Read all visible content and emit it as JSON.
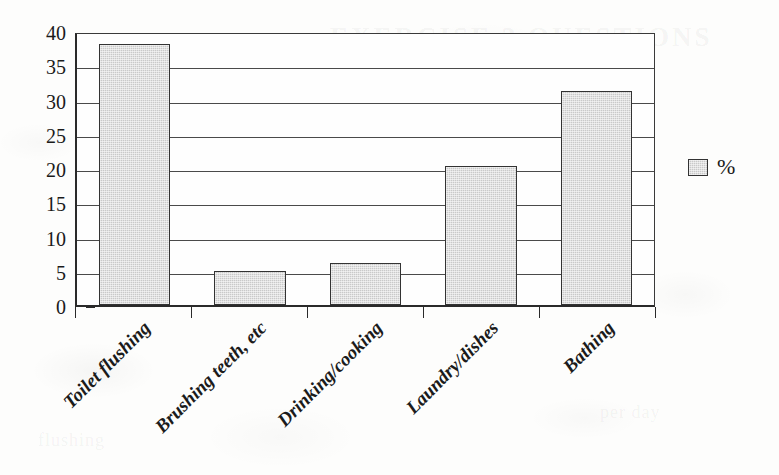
{
  "chart_data": {
    "type": "bar",
    "title": "",
    "subtitle": "",
    "xlabel": "",
    "ylabel": "",
    "categories": [
      "Toilet flushing",
      "Brushing teeth, etc",
      "Drinking/cooking",
      "Laundry/dishes",
      "Bathing"
    ],
    "values": [
      38.1,
      5.0,
      6.1,
      20.3,
      31.2
    ],
    "series": [
      {
        "name": "%",
        "values": [
          38.1,
          5.0,
          6.1,
          20.3,
          31.2
        ]
      }
    ],
    "ylim": [
      0,
      40
    ],
    "ytick_labels": [
      "0",
      "5",
      "10",
      "15",
      "20",
      "25",
      "30",
      "35",
      "40"
    ],
    "ytick_values": [
      0,
      5,
      10,
      15,
      20,
      25,
      30,
      35,
      40
    ],
    "grid": "horizontal",
    "legend": {
      "position": "right",
      "entries": [
        {
          "label": "%",
          "swatch_color": "#c9c9c9"
        }
      ]
    },
    "colors": {
      "bar_fill": "#c9c9c9",
      "bar_border": "#333333",
      "axis": "#2a2a2a",
      "gridline": "#4a4a4a",
      "text": "#1a1a1a",
      "background": "#fdfdfc"
    },
    "annotations": []
  },
  "bleed_text": {
    "top": "EXERCISE 2  QUESTIONS",
    "mid_left": "water",
    "mid_right": "household",
    "bottom_left": "flushing",
    "bottom_right": "per day"
  }
}
